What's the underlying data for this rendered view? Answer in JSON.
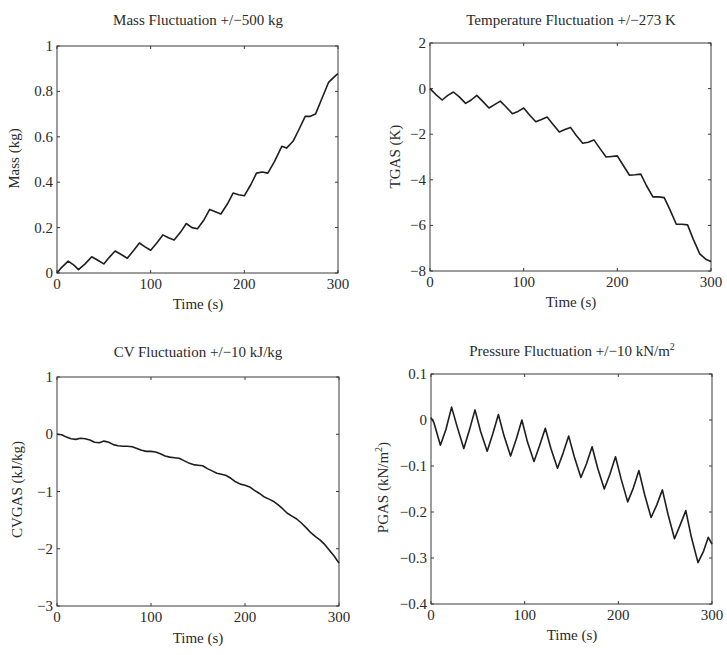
{
  "chart_data": [
    {
      "type": "line",
      "title": "Mass Fluctuation +/−500 kg",
      "xlabel": "Time (s)",
      "ylabel": "Mass (kg)",
      "xlim": [
        0,
        300
      ],
      "ylim": [
        0,
        1
      ],
      "xticks": [
        "0",
        "100",
        "200",
        "300"
      ],
      "yticks": [
        "0",
        "0.2",
        "0.4",
        "0.6",
        "0.8",
        "1"
      ],
      "grid": false,
      "series": [
        {
          "name": "Mass",
          "x": [
            0,
            5,
            12,
            18,
            23,
            30,
            37,
            44,
            50,
            56,
            62,
            69,
            75,
            82,
            88,
            94,
            100,
            107,
            113,
            119,
            125,
            132,
            138,
            144,
            150,
            157,
            163,
            169,
            175,
            182,
            188,
            194,
            200,
            207,
            213,
            219,
            225,
            232,
            240,
            245,
            252,
            258,
            265,
            270,
            276,
            282,
            290,
            298,
            300
          ],
          "values": [
            0,
            0.025,
            0.052,
            0.035,
            0.015,
            0.04,
            0.072,
            0.055,
            0.04,
            0.07,
            0.097,
            0.08,
            0.065,
            0.1,
            0.132,
            0.115,
            0.1,
            0.135,
            0.168,
            0.155,
            0.145,
            0.18,
            0.218,
            0.2,
            0.195,
            0.235,
            0.28,
            0.27,
            0.26,
            0.305,
            0.352,
            0.345,
            0.34,
            0.39,
            0.44,
            0.445,
            0.44,
            0.49,
            0.558,
            0.55,
            0.58,
            0.63,
            0.69,
            0.69,
            0.7,
            0.76,
            0.84,
            0.872,
            0.878
          ]
        }
      ]
    },
    {
      "type": "line",
      "title": "Temperature Fluctuation +/−273 K",
      "xlabel": "Time (s)",
      "ylabel": "TGAS (K)",
      "xlim": [
        0,
        300
      ],
      "ylim": [
        -8,
        2
      ],
      "xticks": [
        "0",
        "100",
        "200",
        "300"
      ],
      "yticks": [
        "−8",
        "−6",
        "−4",
        "−2",
        "0",
        "2"
      ],
      "grid": false,
      "series": [
        {
          "name": "TGAS",
          "x": [
            0,
            6,
            13,
            19,
            25,
            31,
            38,
            44,
            50,
            56,
            63,
            69,
            75,
            81,
            88,
            94,
            100,
            106,
            113,
            119,
            125,
            131,
            138,
            144,
            150,
            156,
            163,
            169,
            175,
            181,
            188,
            194,
            200,
            206,
            213,
            219,
            225,
            231,
            238,
            244,
            250,
            256,
            263,
            269,
            275,
            281,
            288,
            295,
            300
          ],
          "values": [
            0,
            -0.25,
            -0.5,
            -0.3,
            -0.15,
            -0.35,
            -0.65,
            -0.5,
            -0.3,
            -0.55,
            -0.85,
            -0.7,
            -0.55,
            -0.8,
            -1.1,
            -1.0,
            -0.85,
            -1.15,
            -1.45,
            -1.35,
            -1.25,
            -1.55,
            -1.9,
            -1.8,
            -1.7,
            -2.05,
            -2.4,
            -2.35,
            -2.25,
            -2.6,
            -3.0,
            -2.98,
            -2.95,
            -3.35,
            -3.8,
            -3.78,
            -3.75,
            -4.25,
            -4.75,
            -4.75,
            -4.78,
            -5.3,
            -5.95,
            -5.95,
            -5.98,
            -6.6,
            -7.25,
            -7.5,
            -7.58
          ]
        }
      ]
    },
    {
      "type": "line",
      "title": "CV Fluctuation +/−10 kJ/kg",
      "xlabel": "Time (s)",
      "ylabel": "CVGAS (kJ/kg)",
      "xlim": [
        0,
        300
      ],
      "ylim": [
        -3,
        1
      ],
      "xticks": [
        "0",
        "100",
        "200",
        "300"
      ],
      "yticks": [
        "−3",
        "−2",
        "−1",
        "0",
        "1"
      ],
      "grid": false,
      "series": [
        {
          "name": "CVGAS",
          "x": [
            0,
            5,
            10,
            15,
            20,
            25,
            30,
            35,
            40,
            45,
            50,
            55,
            60,
            65,
            70,
            75,
            80,
            85,
            90,
            95,
            100,
            105,
            110,
            115,
            120,
            125,
            130,
            135,
            140,
            145,
            150,
            155,
            160,
            165,
            170,
            175,
            180,
            185,
            190,
            195,
            200,
            205,
            210,
            215,
            220,
            225,
            230,
            235,
            240,
            245,
            250,
            255,
            260,
            265,
            270,
            275,
            280,
            285,
            290,
            295,
            300
          ],
          "values": [
            0,
            -0.01,
            -0.05,
            -0.08,
            -0.09,
            -0.07,
            -0.08,
            -0.1,
            -0.14,
            -0.15,
            -0.12,
            -0.14,
            -0.18,
            -0.2,
            -0.21,
            -0.21,
            -0.22,
            -0.25,
            -0.28,
            -0.3,
            -0.3,
            -0.31,
            -0.34,
            -0.38,
            -0.4,
            -0.41,
            -0.42,
            -0.46,
            -0.5,
            -0.53,
            -0.54,
            -0.55,
            -0.6,
            -0.64,
            -0.68,
            -0.7,
            -0.72,
            -0.77,
            -0.83,
            -0.87,
            -0.89,
            -0.92,
            -0.98,
            -1.03,
            -1.09,
            -1.13,
            -1.17,
            -1.23,
            -1.3,
            -1.38,
            -1.43,
            -1.48,
            -1.55,
            -1.63,
            -1.72,
            -1.79,
            -1.85,
            -1.93,
            -2.03,
            -2.13,
            -2.25
          ]
        }
      ]
    },
    {
      "type": "line",
      "title": "Pressure Fluctuation +/−10 kN/m²",
      "xlabel": "Time (s)",
      "ylabel": "PGAS (kN/m²)",
      "xlim": [
        0,
        300
      ],
      "ylim": [
        -0.4,
        0.1
      ],
      "xticks": [
        "0",
        "100",
        "200",
        "300"
      ],
      "yticks": [
        "−0.4",
        "−0.3",
        "−0.2",
        "−0.1",
        "0",
        "0.1"
      ],
      "grid": false,
      "series": [
        {
          "name": "PGAS",
          "x": [
            0,
            3,
            10,
            16,
            22,
            28,
            35,
            41,
            47,
            53,
            60,
            66,
            72,
            78,
            85,
            91,
            97,
            103,
            110,
            116,
            122,
            128,
            135,
            141,
            147,
            153,
            160,
            166,
            172,
            178,
            185,
            191,
            197,
            203,
            210,
            216,
            222,
            228,
            235,
            241,
            247,
            253,
            260,
            266,
            272,
            278,
            285,
            291,
            296,
            300
          ],
          "values": [
            0.005,
            -0.005,
            -0.055,
            -0.02,
            0.028,
            -0.015,
            -0.062,
            -0.022,
            0.022,
            -0.025,
            -0.068,
            -0.03,
            0.012,
            -0.035,
            -0.078,
            -0.042,
            0.0,
            -0.048,
            -0.09,
            -0.055,
            -0.018,
            -0.062,
            -0.105,
            -0.072,
            -0.035,
            -0.08,
            -0.125,
            -0.095,
            -0.058,
            -0.105,
            -0.15,
            -0.118,
            -0.08,
            -0.128,
            -0.178,
            -0.148,
            -0.11,
            -0.162,
            -0.212,
            -0.185,
            -0.152,
            -0.205,
            -0.258,
            -0.228,
            -0.197,
            -0.255,
            -0.31,
            -0.285,
            -0.255,
            -0.27
          ]
        }
      ]
    }
  ],
  "panels": [
    {
      "title": "Mass Fluctuation +/−500 kg",
      "xlabel": "Time (s)",
      "ylabel": "Mass (kg)"
    },
    {
      "title": "Temperature Fluctuation +/−273 K",
      "xlabel": "Time (s)",
      "ylabel": "TGAS (K)"
    },
    {
      "title_main": "CV Fluctuation +/−10 kJ/kg",
      "xlabel": "Time (s)",
      "ylabel": "CVGAS (kJ/kg)"
    },
    {
      "title_main": "Pressure Fluctuation +/−10 kN/m",
      "title_sup": "2",
      "xlabel": "Time (s)",
      "ylabel_main": "PGAS (kN/m",
      "ylabel_sup": "2",
      "ylabel_end": ")"
    }
  ],
  "style": {
    "line_color": "#1e1e1e",
    "axis_color": "#3a3a3a"
  }
}
